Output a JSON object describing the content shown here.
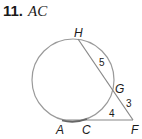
{
  "problem": {
    "number": "11.",
    "unknown": "AC"
  },
  "diagram": {
    "points": {
      "H": "H",
      "G": "G",
      "F": "F",
      "A": "A",
      "C": "C"
    },
    "lengths": {
      "HG": "5",
      "GF": "3",
      "CF": "4"
    },
    "colors": {
      "circle": "#999999",
      "lines": "#888888",
      "text": "#1a1a1a"
    }
  }
}
